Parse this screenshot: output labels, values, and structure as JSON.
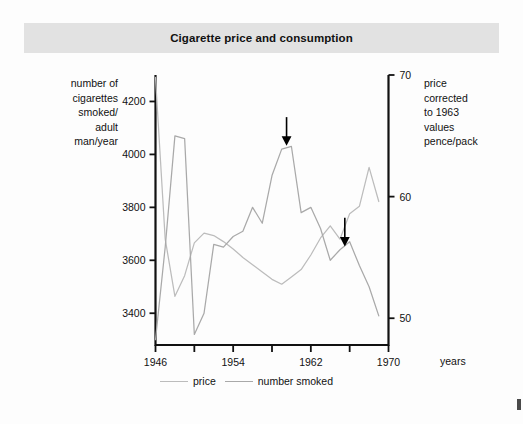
{
  "title": "Cigarette price and consumption",
  "axes": {
    "left_caption": [
      "number of",
      "cigarettes",
      "smoked/",
      "adult",
      "man/year"
    ],
    "right_caption": [
      "price",
      "corrected",
      "to 1963",
      "values",
      "pence/pack"
    ],
    "x_caption": "years",
    "left_ticks": [
      "4200",
      "4000",
      "3800",
      "3600",
      "3400"
    ],
    "right_ticks": [
      "70",
      "60",
      "50"
    ],
    "x_ticks": [
      "1946",
      "1954",
      "1962",
      "1970"
    ]
  },
  "legend": {
    "items": [
      {
        "label": "price",
        "color": "#bcbcbc"
      },
      {
        "label": "number smoked",
        "color": "#a9a9a9"
      }
    ]
  },
  "annotations": [
    {
      "name": "arrow-1965",
      "type": "down-arrow",
      "year": 1959.5
    },
    {
      "name": "arrow-1967",
      "type": "down-arrow",
      "year": 1965.5
    }
  ],
  "chart_data": {
    "type": "line",
    "title": "Cigarette price and consumption",
    "xlabel": "years",
    "ylabel": "number of cigarettes smoked/adult man/year",
    "y2label": "price corrected to 1963 values pence/pack",
    "xlim": [
      1946,
      1970
    ],
    "ylim": [
      3280,
      4300
    ],
    "y2lim": [
      47.8,
      70
    ],
    "grid": false,
    "legend_position": "bottom",
    "x": [
      1946,
      1947,
      1948,
      1949,
      1950,
      1951,
      1952,
      1953,
      1954,
      1955,
      1956,
      1957,
      1958,
      1959,
      1960,
      1961,
      1962,
      1963,
      1964,
      1965,
      1966,
      1967,
      1968,
      1969
    ],
    "series": [
      {
        "name": "price",
        "axis": "right",
        "units": "pence/pack",
        "color": "#bcbcbc",
        "values": [
          69.8,
          56.5,
          51.8,
          53.5,
          56.2,
          57.0,
          56.8,
          56.3,
          55.7,
          55.0,
          54.4,
          53.8,
          53.2,
          52.8,
          53.4,
          54.0,
          55.2,
          56.6,
          57.6,
          56.5,
          58.6,
          59.2,
          62.4,
          59.6
        ]
      },
      {
        "name": "number smoked",
        "axis": "left",
        "units": "cigarettes/adult man/year",
        "color": "#a9a9a9",
        "values": [
          3300,
          3650,
          4070,
          4060,
          3320,
          3400,
          3660,
          3650,
          3690,
          3710,
          3800,
          3740,
          3920,
          4020,
          4030,
          3780,
          3800,
          3720,
          3600,
          3640,
          3670,
          3580,
          3500,
          3390
        ]
      }
    ]
  }
}
